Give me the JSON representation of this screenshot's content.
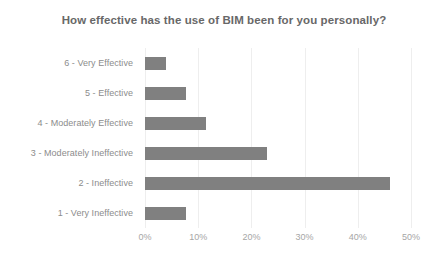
{
  "chart_data": {
    "type": "bar",
    "orientation": "horizontal",
    "title": "How effective has the use of BIM been for you personally?",
    "xlabel": "",
    "ylabel": "",
    "xlim": [
      0,
      50
    ],
    "xticks": [
      "0%",
      "10%",
      "20%",
      "30%",
      "40%",
      "50%"
    ],
    "xtick_values": [
      0,
      10,
      20,
      30,
      40,
      50
    ],
    "grid": true,
    "legend": false,
    "bar_color": "#808080",
    "categories": [
      "6 - Very Effective",
      "5 - Effective",
      "4 - Moderately Effective",
      "3 - Moderately Ineffective",
      "2 - Ineffective",
      "1 - Very Ineffective"
    ],
    "values": [
      4,
      7.7,
      11.5,
      23,
      46,
      7.7
    ]
  }
}
